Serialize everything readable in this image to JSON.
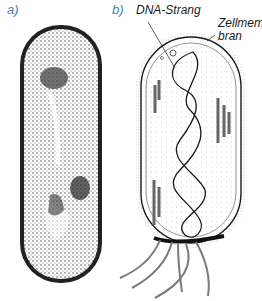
{
  "panels": [
    {
      "id": "a",
      "label": "a)",
      "description": "Electron-micrograph-style stippled drawing of a rod-shaped bacterium"
    },
    {
      "id": "b",
      "label": "b)",
      "description": "Schematic line drawing of a rod-shaped bacterium with flagella"
    }
  ],
  "annotations": {
    "dna": "DNA-Strang",
    "membrane_line1": "Zellmem-",
    "membrane_line2": "bran"
  },
  "colors": {
    "label_blue": "#4a7fb5",
    "ink": "#1a1a1a",
    "flagella": "#7a7a7a"
  }
}
